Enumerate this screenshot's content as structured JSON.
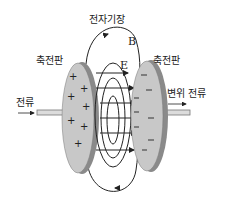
{
  "diagram": {
    "title_label": "전자기장",
    "magnetic_field_label": "B",
    "electric_field_label": "E",
    "left_plate_label": "축전판",
    "right_plate_label": "축전판",
    "current_label": "전류",
    "displacement_current_label": "변위 전류",
    "left_plate_charge": "+",
    "right_plate_charge": "−",
    "colors": {
      "plate_face": "#c8c8c8",
      "plate_edge": "#8a8a8a",
      "wire": "#d8d8d8",
      "line": "#222222"
    }
  }
}
